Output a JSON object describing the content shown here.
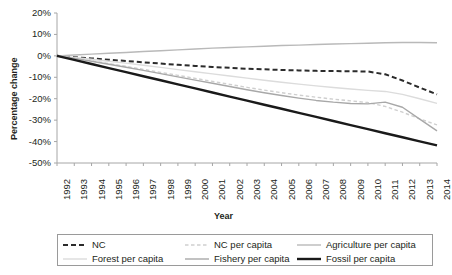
{
  "chart_data": {
    "type": "line",
    "title": "",
    "xlabel": "Year",
    "ylabel": "Percentage change",
    "grid": false,
    "legend_position": "bottom",
    "xlim": [
      1992,
      2014
    ],
    "ylim": [
      -50,
      20
    ],
    "ytick_labels": [
      "20%",
      "10%",
      "0%",
      "-10%",
      "-20%",
      "-30%",
      "-40%",
      "-50%"
    ],
    "ytick_values": [
      20,
      10,
      0,
      -10,
      -20,
      -30,
      -40,
      -50
    ],
    "x": [
      1992,
      1993,
      1994,
      1995,
      1996,
      1997,
      1998,
      1999,
      2000,
      2001,
      2002,
      2003,
      2004,
      2005,
      2006,
      2007,
      2008,
      2009,
      2010,
      2011,
      2012,
      2013,
      2014
    ],
    "xtick_labels": [
      "1992",
      "1993",
      "1994",
      "1995",
      "1996",
      "1997",
      "1998",
      "1999",
      "2000",
      "2001",
      "2002",
      "2003",
      "2004",
      "2005",
      "2006",
      "2007",
      "2008",
      "2009",
      "2010",
      "2011",
      "2012",
      "2013",
      "2014"
    ],
    "series": [
      {
        "name": "NC",
        "style": "dashed",
        "color": "#2b2b2b",
        "width": 2.0,
        "values": [
          0,
          -0.6,
          -1.2,
          -1.8,
          -2.4,
          -3.0,
          -3.6,
          -4.2,
          -4.7,
          -5.2,
          -5.6,
          -6.0,
          -6.3,
          -6.6,
          -6.8,
          -7.0,
          -7.1,
          -7.2,
          -7.3,
          -8.6,
          -11.5,
          -14.8,
          -18.0
        ]
      },
      {
        "name": "NC per capita",
        "style": "dashed",
        "color": "#cfcfcf",
        "width": 1.4,
        "values": [
          0,
          -1.1,
          -2.3,
          -3.6,
          -4.9,
          -6.3,
          -7.7,
          -9.1,
          -10.5,
          -11.9,
          -13.3,
          -14.7,
          -16.0,
          -17.2,
          -18.3,
          -19.3,
          -20.2,
          -21.0,
          -21.8,
          -23.6,
          -26.3,
          -29.4,
          -32.2
        ]
      },
      {
        "name": "Agriculture per capita",
        "style": "solid",
        "color": "#b9b9b9",
        "width": 1.4,
        "values": [
          0,
          0.4,
          0.8,
          1.2,
          1.6,
          2.0,
          2.4,
          2.8,
          3.2,
          3.6,
          3.9,
          4.2,
          4.5,
          4.8,
          5.0,
          5.3,
          5.5,
          5.7,
          5.9,
          6.1,
          6.2,
          6.2,
          6.1
        ]
      },
      {
        "name": "Forest per capita",
        "style": "solid",
        "color": "#dcdcdc",
        "width": 1.4,
        "values": [
          0,
          -0.8,
          -1.6,
          -2.5,
          -3.4,
          -4.4,
          -5.4,
          -6.4,
          -7.4,
          -8.4,
          -9.4,
          -10.4,
          -11.4,
          -12.3,
          -13.2,
          -14.0,
          -14.8,
          -15.5,
          -16.1,
          -16.6,
          -18.0,
          -20.0,
          -22.2
        ]
      },
      {
        "name": "Fishery per capita",
        "style": "solid",
        "color": "#a8a8a8",
        "width": 1.4,
        "values": [
          0,
          -1.2,
          -2.5,
          -3.9,
          -5.3,
          -6.8,
          -8.3,
          -9.8,
          -11.3,
          -12.8,
          -14.3,
          -15.8,
          -17.2,
          -18.5,
          -19.7,
          -20.8,
          -21.6,
          -22.2,
          -22.4,
          -21.6,
          -24.0,
          -29.5,
          -35.0
        ]
      },
      {
        "name": "Fossil per capita",
        "style": "solid",
        "color": "#1a1a1a",
        "width": 2.4,
        "values": [
          0,
          -1.9,
          -3.8,
          -5.7,
          -7.6,
          -9.5,
          -11.4,
          -13.3,
          -15.2,
          -17.1,
          -19.0,
          -20.9,
          -22.8,
          -24.7,
          -26.6,
          -28.5,
          -30.4,
          -32.3,
          -34.2,
          -36.1,
          -38.0,
          -39.9,
          -41.8
        ]
      }
    ]
  },
  "legend": {
    "entries": [
      {
        "label": "NC",
        "series": "NC"
      },
      {
        "label": "NC per capita",
        "series": "NC per capita"
      },
      {
        "label": "Agriculture per capita",
        "series": "Agriculture per capita"
      },
      {
        "label": "Forest per capita",
        "series": "Forest per capita"
      },
      {
        "label": "Fishery per capita",
        "series": "Fishery per capita"
      },
      {
        "label": "Fossil per capita",
        "series": "Fossil per capita"
      }
    ]
  }
}
